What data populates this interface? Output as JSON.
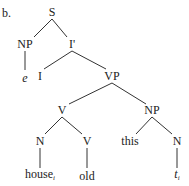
{
  "example_label": "b.",
  "tree": {
    "nodes": [
      {
        "id": "S",
        "label": "S",
        "x": 52,
        "y": 12
      },
      {
        "id": "NP1",
        "label": "NP",
        "x": 25,
        "y": 44
      },
      {
        "id": "Ibar",
        "label": "I'",
        "x": 72,
        "y": 44
      },
      {
        "id": "e",
        "label": "e",
        "x": 25,
        "y": 78,
        "italic": true
      },
      {
        "id": "I",
        "label": "I",
        "x": 40,
        "y": 76
      },
      {
        "id": "VP",
        "label": "VP",
        "x": 112,
        "y": 76
      },
      {
        "id": "V1",
        "label": "V",
        "x": 62,
        "y": 110
      },
      {
        "id": "NP2",
        "label": "NP",
        "x": 152,
        "y": 110
      },
      {
        "id": "N1",
        "label": "N",
        "x": 40,
        "y": 141
      },
      {
        "id": "V2",
        "label": "V",
        "x": 87,
        "y": 141
      },
      {
        "id": "this",
        "label": "this",
        "x": 130,
        "y": 141
      },
      {
        "id": "N2",
        "label": "N",
        "x": 177,
        "y": 141
      },
      {
        "id": "house",
        "label": "house",
        "sub": "i",
        "x": 40,
        "y": 176
      },
      {
        "id": "old",
        "label": "old",
        "x": 87,
        "y": 176
      },
      {
        "id": "t",
        "label": "t",
        "sub": "i",
        "x": 177,
        "y": 176,
        "italic": true
      }
    ],
    "edges": [
      [
        52,
        19,
        34,
        37
      ],
      [
        52,
        19,
        67,
        37
      ],
      [
        25,
        51,
        25,
        70
      ],
      [
        72,
        51,
        44,
        69
      ],
      [
        72,
        51,
        106,
        69
      ],
      [
        112,
        83,
        69,
        104
      ],
      [
        112,
        83,
        146,
        104
      ],
      [
        62,
        117,
        45,
        134
      ],
      [
        62,
        117,
        82,
        134
      ],
      [
        152,
        117,
        136,
        134
      ],
      [
        152,
        117,
        172,
        134
      ],
      [
        40,
        148,
        40,
        168
      ],
      [
        87,
        148,
        87,
        168
      ],
      [
        177,
        148,
        177,
        168
      ]
    ],
    "line_color": "#333333"
  }
}
